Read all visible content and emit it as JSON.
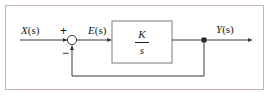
{
  "diagram": {
    "type": "control-block-diagram",
    "frame": {
      "border_color": "#c8b4b6",
      "background_color": "#ffffff"
    },
    "line_color": "#3a3a3a",
    "text_color": "#1a1a1a",
    "signals": {
      "input": {
        "name": "X(s)",
        "var": "X",
        "arg": "(s)"
      },
      "error": {
        "name": "E(s)",
        "var": "E",
        "arg": "(s)"
      },
      "output": {
        "name": "Y(s)",
        "var": "Y",
        "arg": "(s)"
      }
    },
    "summing_junction": {
      "name": "summing-junction",
      "shape": "circle",
      "plus_sign": "+",
      "minus_sign": "−",
      "plus_input": "X(s)",
      "minus_input": "Y(s)"
    },
    "transfer_block": {
      "name": "transfer-function-block",
      "numerator": "K",
      "denominator": "s",
      "expression": "K/s"
    },
    "takeoff_node": {
      "name": "feedback-takeoff-node",
      "signal": "Y(s)"
    },
    "feedback_path": {
      "name": "unity-feedback-path",
      "gain": "1",
      "sign": "negative"
    }
  }
}
